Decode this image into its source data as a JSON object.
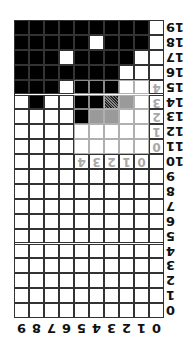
{
  "board": {
    "columns": 10,
    "rows": 20,
    "orientation": "rotated-180",
    "row_labels": [
      "19",
      "18",
      "17",
      "16",
      "15",
      "14",
      "13",
      "12",
      "11",
      "10",
      "9",
      "8",
      "7",
      "6",
      "5",
      "4",
      "3",
      "2",
      "1",
      "0"
    ],
    "col_labels_visual": [
      "9",
      "8",
      "7",
      "6",
      "5",
      "4",
      "3",
      "2",
      "1",
      "0"
    ],
    "cells_visual": [
      "BBBBBBBBBW",
      "BBBBBWBBBW",
      "BBBWBBBBWW",
      "BBBBBBBWWW",
      "BBBWBBBWWW",
      "WBWWBBDGWW",
      "WWWWBGGWWW",
      "WWWWWWWWWW",
      "WWWWWWWWWW",
      "WWWWWWWWWW",
      "WWWWWWWWWW",
      "WWWWWWWWWW",
      "WWWWWWWWWW",
      "WWWWWWWWWW",
      "WWWWWWWWWW",
      "WWWWWWWWWW",
      "WWWWWWWWWW",
      "WWWWWWWWWW",
      "WWWWWWWWWW",
      "WWWWWWWWWW"
    ],
    "legend": {
      "B": "filled",
      "W": "empty",
      "G": "piece-gray",
      "D": "piece-dithered"
    },
    "colors": {
      "filled": "#000000",
      "empty": "#ffffff",
      "piece_gray": "#9a9a9a",
      "overlay_label": "#a8a8a8"
    }
  },
  "preview_overlay": {
    "visual_cols": [
      4,
      5,
      6,
      7,
      8
    ],
    "visual_rows": [
      4,
      5,
      6,
      7,
      8
    ],
    "row_labels": [
      "4",
      "3",
      "2",
      "1",
      "0"
    ],
    "col_labels_visual": [
      "4",
      "3",
      "2",
      "1",
      "0"
    ]
  }
}
